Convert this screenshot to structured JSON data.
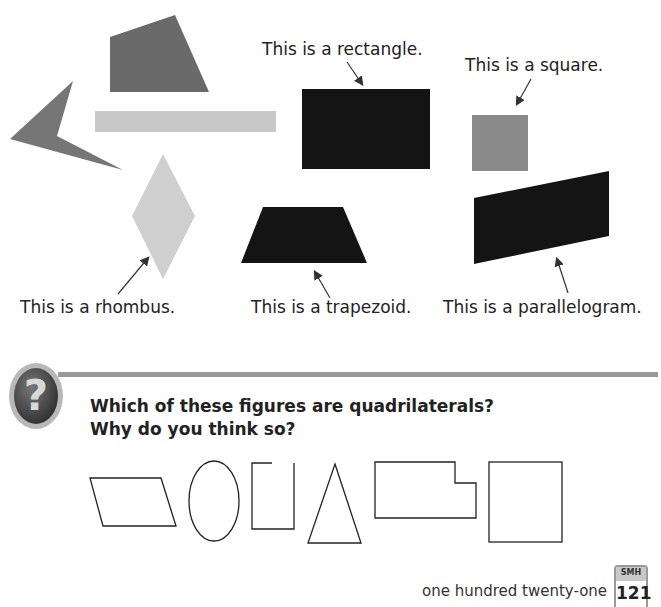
{
  "figures": {
    "labels": {
      "rectangle": "This is a rectangle.",
      "square": "This is a square.",
      "rhombus": "This is a rhombus.",
      "trapezoid": "This is a trapezoid.",
      "parallelogram": "This is a parallelogram."
    },
    "colors": {
      "quad_dark_gray": "#6a6a6a",
      "arrow_shape": "#767676",
      "long_bar": "#c8c8c8",
      "rhombus": "#cfcfcf",
      "black_shapes": "#141414",
      "square": "#8a8a8a"
    }
  },
  "question": {
    "line1": "Which of these figures are quadrilaterals?",
    "line2": "Why do you think so?",
    "outline_shapes": [
      "parallelogram",
      "oval",
      "open-rectangle",
      "triangle",
      "notched-rectangle",
      "square"
    ]
  },
  "footer": {
    "page_words": "one hundred twenty-one",
    "badge_label": "SMH",
    "page_number": "121"
  }
}
